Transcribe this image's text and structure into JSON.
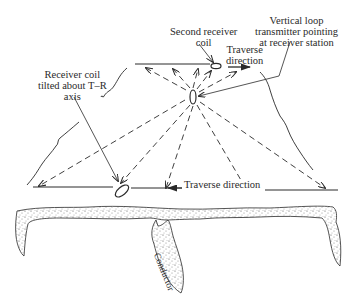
{
  "diagram": {
    "labels": {
      "second_receiver": [
        "Second receiver",
        "coil"
      ],
      "transmitter": [
        "Vertical loop",
        "transmitter pointing",
        "at receiver station"
      ],
      "traverse_upper": [
        "Traverse",
        "direction"
      ],
      "receiver_tilted": [
        "Receiver coil",
        "tilted about T–R",
        "axis"
      ],
      "traverse_lower": "Traverse direction",
      "conductor": "Conductor"
    },
    "colors": {
      "ink": "#2a2a2a",
      "stipple": "#6a6a6a"
    }
  }
}
